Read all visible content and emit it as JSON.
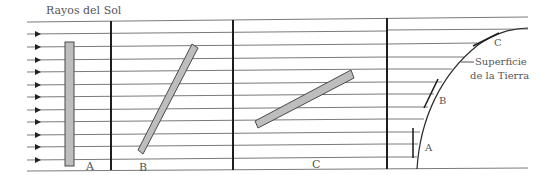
{
  "diagram": {
    "title": "Rayos del Sol",
    "panels": [
      {
        "label": "A"
      },
      {
        "label": "B"
      },
      {
        "label": "C"
      }
    ],
    "earth": {
      "label_line1": "Superficie",
      "label_line2": "de la Tierra",
      "surfaces": [
        {
          "label": "A"
        },
        {
          "label": "B"
        },
        {
          "label": "C"
        }
      ]
    },
    "colors": {
      "ray": "#7a7a7a",
      "divider": "#1e1e1e",
      "bar_fill": "#bdbdbd",
      "bar_stroke": "#4a4a4a",
      "text": "#555555"
    }
  }
}
